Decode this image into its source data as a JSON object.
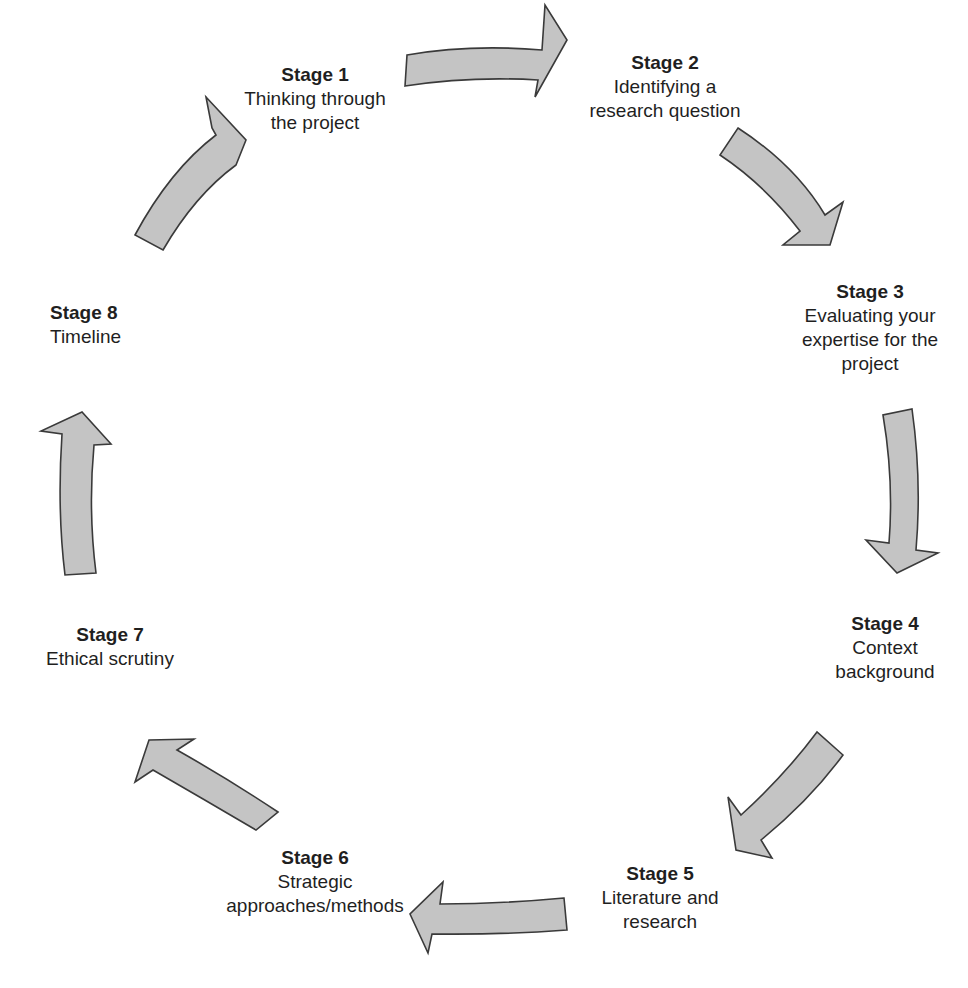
{
  "diagram": {
    "type": "cycle",
    "direction": "clockwise",
    "arrow_fill": "#c4c4c4",
    "arrow_stroke": "#3a3a3a",
    "stages": [
      {
        "title": "Stage 1",
        "description": "Thinking through\nthe project"
      },
      {
        "title": "Stage 2",
        "description": "Identifying a\nresearch question"
      },
      {
        "title": "Stage 3",
        "description": "Evaluating your\nexpertise for the\nproject"
      },
      {
        "title": "Stage 4",
        "description": "Context\nbackground"
      },
      {
        "title": "Stage 5",
        "description": "Literature and\nresearch"
      },
      {
        "title": "Stage 6",
        "description": "Strategic\napproaches/methods"
      },
      {
        "title": "Stage 7",
        "description": "Ethical scrutiny"
      },
      {
        "title": "Stage 8",
        "description": "Timeline"
      }
    ],
    "arrows": [
      {
        "from": "Stage 1",
        "to": "Stage 2"
      },
      {
        "from": "Stage 2",
        "to": "Stage 3"
      },
      {
        "from": "Stage 3",
        "to": "Stage 4"
      },
      {
        "from": "Stage 4",
        "to": "Stage 5"
      },
      {
        "from": "Stage 5",
        "to": "Stage 6"
      },
      {
        "from": "Stage 6",
        "to": "Stage 7"
      },
      {
        "from": "Stage 7",
        "to": "Stage 8"
      },
      {
        "from": "Stage 8",
        "to": "Stage 1"
      }
    ]
  }
}
